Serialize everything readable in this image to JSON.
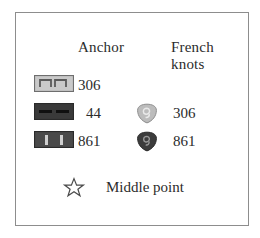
{
  "legend": {
    "headers": {
      "swatch": "",
      "anchor": "Anchor",
      "french_knots_line1": "French",
      "french_knots_line2": "knots"
    },
    "rows": [
      {
        "swatch_name": "backstitch-light-swatch",
        "swatch_fill": "#c9c9c9",
        "swatch_border": "#6e6e6e",
        "swatch_mark": "#5a5a5a",
        "anchor": "306",
        "knot_symbol": "",
        "knot_fill": "",
        "french": ""
      },
      {
        "swatch_name": "backstitch-dark-swatch",
        "swatch_fill": "#3a3a3a",
        "swatch_border": "#2a2a2a",
        "swatch_mark": "#111111",
        "anchor": "44",
        "knot_symbol": "french-knot-light-icon",
        "knot_fill": "#b5b5b5",
        "french": "306"
      },
      {
        "swatch_name": "backstitch-medium-swatch",
        "swatch_fill": "#4a4a4a",
        "swatch_border": "#2a2a2a",
        "swatch_mark": "#c8c8c8",
        "anchor": "861",
        "knot_symbol": "french-knot-dark-icon",
        "knot_fill": "#3c3c3c",
        "french": "861"
      }
    ],
    "middle_point": {
      "icon": "star-outline-icon",
      "label": "Middle point"
    },
    "colors": {
      "text": "#2b2b2b",
      "frame_border": "#8d8d8d",
      "background": "#ffffff"
    }
  }
}
